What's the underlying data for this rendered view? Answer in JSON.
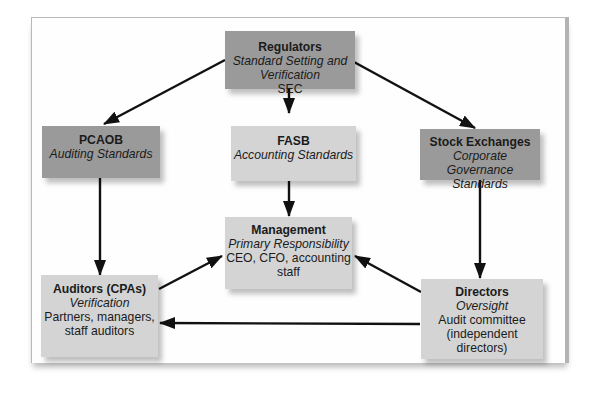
{
  "diagram": {
    "type": "flowchart",
    "nodes": [
      {
        "id": "regulators",
        "title": "Regulators",
        "subtitle": "Standard Setting and Verification",
        "detail": "SEC",
        "fill": "#9a9a9a"
      },
      {
        "id": "pcaob",
        "title": "PCAOB",
        "subtitle": "Auditing Standards",
        "detail": "",
        "fill": "#9a9a9a"
      },
      {
        "id": "fasb",
        "title": "FASB",
        "subtitle": "Accounting Standards",
        "detail": "",
        "fill": "#d4d4d4"
      },
      {
        "id": "stock_exchanges",
        "title": "Stock Exchanges",
        "subtitle": "Corporate Governance Standards",
        "detail": "",
        "fill": "#9a9a9a"
      },
      {
        "id": "management",
        "title": "Management",
        "subtitle": "Primary Responsibility",
        "detail": "CEO, CFO, accounting staff",
        "fill": "#d4d4d4"
      },
      {
        "id": "auditors",
        "title": "Auditors (CPAs)",
        "subtitle": "Verification",
        "detail": "Partners, managers, staff auditors",
        "fill": "#d4d4d4"
      },
      {
        "id": "directors",
        "title": "Directors",
        "subtitle": "Oversight",
        "detail": "Audit committee (independent directors)",
        "fill": "#d4d4d4"
      }
    ],
    "edges": [
      {
        "from": "regulators",
        "to": "pcaob"
      },
      {
        "from": "regulators",
        "to": "fasb"
      },
      {
        "from": "regulators",
        "to": "stock_exchanges"
      },
      {
        "from": "pcaob",
        "to": "auditors"
      },
      {
        "from": "fasb",
        "to": "management"
      },
      {
        "from": "stock_exchanges",
        "to": "directors"
      },
      {
        "from": "auditors",
        "to": "management"
      },
      {
        "from": "directors",
        "to": "management"
      },
      {
        "from": "directors",
        "to": "auditors"
      }
    ],
    "colors": {
      "dark_box": "#9a9a9a",
      "light_box": "#d4d4d4",
      "arrow": "#111111",
      "text": "#1b1b1b"
    }
  }
}
